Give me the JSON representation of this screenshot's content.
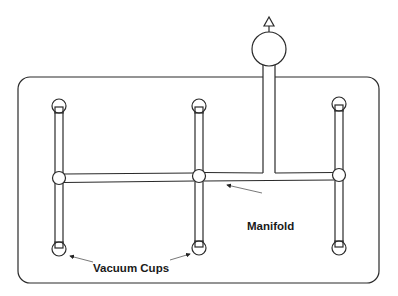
{
  "diagram": {
    "title": "",
    "labels": {
      "manifold": "Manifold",
      "vacuum_cups": "Vacuum Cups"
    },
    "components": {
      "frame": {
        "x": 18,
        "y": 77,
        "width": 361,
        "height": 206,
        "corner_radius": 12
      },
      "pump": {
        "cx": 269,
        "cy": 49,
        "r": 17,
        "exhaust": "triangle-up"
      },
      "vacuum_cups": [
        {
          "id": "cup-top-left",
          "cx": 59,
          "cy": 106
        },
        {
          "id": "cup-bottom-left",
          "cx": 59,
          "cy": 249
        },
        {
          "id": "cup-top-middle",
          "cx": 199,
          "cy": 106
        },
        {
          "id": "cup-bottom-middle",
          "cx": 199,
          "cy": 248
        },
        {
          "id": "cup-top-right",
          "cx": 339,
          "cy": 104
        },
        {
          "id": "cup-bottom-right",
          "cx": 339,
          "cy": 248
        }
      ],
      "junctions": [
        {
          "id": "junction-left",
          "cx": 59,
          "cy": 178
        },
        {
          "id": "junction-middle",
          "cx": 199,
          "cy": 176
        },
        {
          "id": "junction-right",
          "cx": 339,
          "cy": 175
        }
      ]
    },
    "colors": {
      "line": "#2a2a2a",
      "background": "#ffffff",
      "text": "#1a1a1a"
    }
  }
}
